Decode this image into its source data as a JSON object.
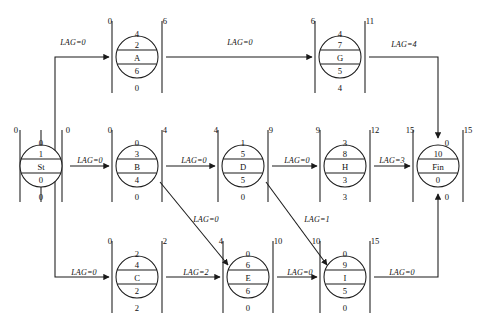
{
  "diagram": {
    "type": "precedence-network",
    "lag_prefix": "LAG="
  },
  "nodes": [
    {
      "id": "St",
      "name": "St",
      "early_start": "0",
      "early_finish": "0",
      "top": "0",
      "upper": "1",
      "lower": "0",
      "bottom": "0",
      "cx": 41,
      "cy": 166
    },
    {
      "id": "A",
      "name": "A",
      "early_start": "0",
      "early_finish": "6",
      "top": "4",
      "upper": "2",
      "lower": "6",
      "bottom": "0",
      "cx": 137,
      "cy": 57
    },
    {
      "id": "B",
      "name": "B",
      "early_start": "0",
      "early_finish": "4",
      "top": "0",
      "upper": "3",
      "lower": "4",
      "bottom": "0",
      "cx": 137,
      "cy": 166
    },
    {
      "id": "C",
      "name": "C",
      "early_start": "0",
      "early_finish": "2",
      "top": "2",
      "upper": "4",
      "lower": "2",
      "bottom": "2",
      "cx": 137,
      "cy": 277
    },
    {
      "id": "D",
      "name": "D",
      "early_start": "4",
      "early_finish": "9",
      "top": "1",
      "upper": "5",
      "lower": "5",
      "bottom": "0",
      "cx": 243,
      "cy": 166
    },
    {
      "id": "E",
      "name": "E",
      "early_start": "4",
      "early_finish": "10",
      "top": "0",
      "upper": "6",
      "lower": "6",
      "bottom": "0",
      "cx": 248,
      "cy": 277
    },
    {
      "id": "G",
      "name": "G",
      "early_start": "6",
      "early_finish": "11",
      "top": "4",
      "upper": "7",
      "lower": "5",
      "bottom": "4",
      "cx": 340,
      "cy": 57
    },
    {
      "id": "H",
      "name": "H",
      "early_start": "9",
      "early_finish": "12",
      "top": "3",
      "upper": "8",
      "lower": "3",
      "bottom": "3",
      "cx": 345,
      "cy": 166
    },
    {
      "id": "I",
      "name": "I",
      "early_start": "10",
      "early_finish": "15",
      "top": "0",
      "upper": "9",
      "lower": "5",
      "bottom": "0",
      "cx": 345,
      "cy": 277
    },
    {
      "id": "Fin",
      "name": "Fin",
      "early_start": "15",
      "early_finish": "15",
      "top": "0",
      "upper": "10",
      "lower": "0",
      "bottom": "0",
      "cx": 438,
      "cy": 166
    }
  ],
  "edges": [
    {
      "id": "st-a",
      "from": "St",
      "to": "A",
      "lag": "LAG=0",
      "lx": 73,
      "ly": 42
    },
    {
      "id": "a-g",
      "from": "A",
      "to": "G",
      "lag": "LAG=0",
      "lx": 240,
      "ly": 42
    },
    {
      "id": "g-fin",
      "from": "G",
      "to": "Fin",
      "lag": "LAG=4",
      "lx": 403,
      "ly": 44
    },
    {
      "id": "st-b",
      "from": "St",
      "to": "B",
      "lag": "LAG=0",
      "lx": 89,
      "ly": 160
    },
    {
      "id": "b-d",
      "from": "B",
      "to": "D",
      "lag": "LAG=0",
      "lx": 194,
      "ly": 160
    },
    {
      "id": "d-h",
      "from": "D",
      "to": "H",
      "lag": "LAG=0",
      "lx": 297,
      "ly": 160
    },
    {
      "id": "h-fin",
      "from": "H",
      "to": "Fin",
      "lag": "LAG=3",
      "lx": 391,
      "ly": 160
    },
    {
      "id": "st-c",
      "from": "St",
      "to": "C",
      "lag": "LAG=0",
      "lx": 83,
      "ly": 272
    },
    {
      "id": "c-e",
      "from": "C",
      "to": "E",
      "lag": "LAG=2",
      "lx": 196,
      "ly": 272
    },
    {
      "id": "e-i",
      "from": "E",
      "to": "I",
      "lag": "LAG=0",
      "lx": 301,
      "ly": 272
    },
    {
      "id": "i-fin",
      "from": "I",
      "to": "Fin",
      "lag": "LAG=0",
      "lx": 401,
      "ly": 272
    },
    {
      "id": "b-e",
      "from": "B",
      "to": "E",
      "lag": "LAG=0",
      "lx": 203,
      "ly": 219
    },
    {
      "id": "d-i",
      "from": "D",
      "to": "I",
      "lag": "LAG=1",
      "lx": 313,
      "ly": 219
    }
  ]
}
